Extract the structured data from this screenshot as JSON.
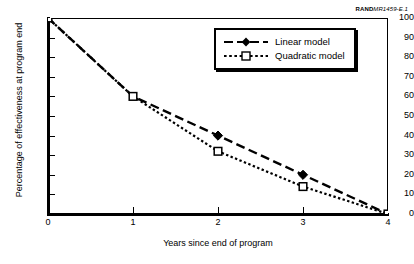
{
  "figure_id": {
    "prefix": "RAND",
    "code": "MR1459-E.1"
  },
  "legend": {
    "position": "top-right",
    "entries": [
      {
        "label": "Linear model",
        "marker": "filled-diamond",
        "line": "dashed",
        "color": "#000000"
      },
      {
        "label": "Quadratic model",
        "marker": "open-square",
        "line": "dotted",
        "color": "#000000"
      }
    ]
  },
  "chart_data": {
    "type": "line",
    "title": "",
    "xlabel": "Years since end of program",
    "ylabel": "Percentage of effectiveness at program end",
    "x": [
      0,
      1,
      2,
      3,
      4
    ],
    "xlim": [
      0,
      4
    ],
    "ylim": [
      0,
      100
    ],
    "xticks": [
      "0",
      "1",
      "2",
      "3",
      "4"
    ],
    "yticks": [
      "0",
      "10",
      "20",
      "30",
      "40",
      "50",
      "60",
      "70",
      "80",
      "90",
      "100"
    ],
    "grid": false,
    "legend_position": "upper right",
    "series": [
      {
        "name": "Linear model",
        "values": [
          100,
          60,
          40,
          20,
          0
        ],
        "marker": "filled-diamond",
        "linestyle": "dashed",
        "marker_x": [
          2,
          3
        ],
        "color": "#000000"
      },
      {
        "name": "Quadratic model",
        "values": [
          100,
          60,
          32,
          14,
          0
        ],
        "marker": "open-square",
        "linestyle": "dotted",
        "marker_x": [
          0,
          1,
          2,
          3,
          4
        ],
        "color": "#000000"
      }
    ]
  }
}
